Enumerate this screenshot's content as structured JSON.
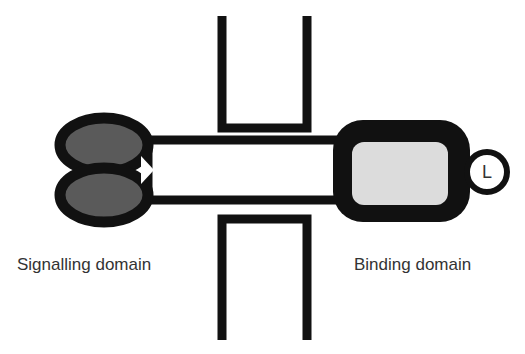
{
  "figure": {
    "background_color": "#ffffff",
    "width": 525,
    "height": 354
  },
  "labels": {
    "signalling_domain": "Signalling domain",
    "binding_domain": "Binding domain",
    "ligand": "L"
  },
  "colors": {
    "outline": "#111111",
    "signalling_fill": "#5a5a5a",
    "binding_inner_fill": "#dcdcdc",
    "rod_fill": "#ffffff",
    "ligand_fill": "#ffffff",
    "text": "#333333",
    "membrane": "#111111"
  },
  "elements": {
    "signalling_ellipse_upper": {
      "name": "upper signalling lobe",
      "cx": 104,
      "cy": 145,
      "rx": 44,
      "ry": 27
    },
    "signalling_ellipse_lower": {
      "name": "lower signalling lobe",
      "cx": 104,
      "cy": 195,
      "rx": 44,
      "ry": 27
    },
    "connecting_rod": {
      "name": "transmembrane connecting rod",
      "x": 145,
      "y": 140,
      "width": 200,
      "height": 60
    },
    "binding_domain_box": {
      "name": "binding domain body",
      "x": 333,
      "y": 120,
      "width": 137,
      "height": 102,
      "corner_radius": 30
    },
    "binding_domain_inner": {
      "name": "binding pocket",
      "x": 352,
      "y": 142,
      "width": 96,
      "height": 63,
      "corner_radius": 12
    },
    "ligand_circle": {
      "name": "ligand",
      "cx": 487,
      "cy": 172,
      "r": 20
    },
    "membrane_upper": {
      "name": "upper membrane leaflet (U shape opening upward)",
      "left_x": 222,
      "right_x": 307,
      "top_y": 16,
      "bottom_y": 128
    },
    "membrane_lower": {
      "name": "lower membrane leaflet (U shape opening downward)",
      "left_x": 222,
      "right_x": 307,
      "top_y": 218,
      "bottom_y": 340
    }
  }
}
